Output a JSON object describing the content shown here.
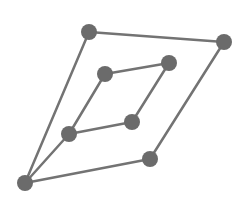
{
  "diagram": {
    "type": "graph",
    "style": {
      "node_color": "#6b6b6b",
      "edge_color": "#737373",
      "background": "#ffffff",
      "node_radius": 8,
      "edge_width": 2.5
    },
    "nodes": [
      {
        "id": "A",
        "x": 89,
        "y": 32
      },
      {
        "id": "B",
        "x": 224,
        "y": 42
      },
      {
        "id": "C",
        "x": 105,
        "y": 74
      },
      {
        "id": "D",
        "x": 169,
        "y": 63
      },
      {
        "id": "E",
        "x": 132,
        "y": 122
      },
      {
        "id": "F",
        "x": 69,
        "y": 134
      },
      {
        "id": "G",
        "x": 150,
        "y": 159
      },
      {
        "id": "H",
        "x": 25,
        "y": 183
      }
    ],
    "edges": [
      [
        "A",
        "B"
      ],
      [
        "A",
        "H"
      ],
      [
        "B",
        "G"
      ],
      [
        "G",
        "H"
      ],
      [
        "C",
        "D"
      ],
      [
        "C",
        "F"
      ],
      [
        "D",
        "E"
      ],
      [
        "E",
        "F"
      ],
      [
        "F",
        "H"
      ]
    ]
  }
}
